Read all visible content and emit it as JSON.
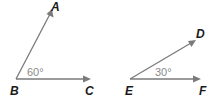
{
  "diagram": {
    "type": "geometry-angles",
    "colors": {
      "ray": "#7a7a7a",
      "point_label": "#1a1a1a",
      "angle_label": "#8a8a8a",
      "background": "#ffffff"
    },
    "angles": [
      {
        "name": "angle-ABC",
        "vertex": {
          "label": "B",
          "x": 16,
          "y": 79
        },
        "rays": [
          {
            "to": "A",
            "x": 52,
            "y": 10
          },
          {
            "to": "C",
            "x": 90,
            "y": 79
          }
        ],
        "measure": "60°"
      },
      {
        "name": "angle-DEF",
        "vertex": {
          "label": "E",
          "x": 130,
          "y": 79
        },
        "rays": [
          {
            "to": "D",
            "x": 195,
            "y": 41
          },
          {
            "to": "F",
            "x": 200,
            "y": 79
          }
        ],
        "measure": "30°"
      }
    ],
    "labels": {
      "A": "A",
      "B": "B",
      "C": "C",
      "D": "D",
      "E": "E",
      "F": "F",
      "angle_b": "60°",
      "angle_e": "30°"
    }
  }
}
